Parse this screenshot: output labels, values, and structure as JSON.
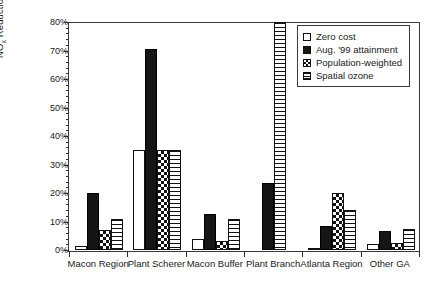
{
  "chart_data": {
    "type": "bar",
    "title": "",
    "xlabel": "",
    "ylabel": "NOx Reduction (%) in Optimal Strategy",
    "ylabel_parts": {
      "prefix": "NO",
      "sub": "x",
      "suffix": " Reduction (%) in Optimal Strategy"
    },
    "ylim": [
      0,
      80
    ],
    "yunit": "%",
    "ytick_labels": [
      "0%",
      "10%",
      "20%",
      "30%",
      "40%",
      "50%",
      "60%",
      "70%",
      "80%"
    ],
    "ytick_values": [
      0,
      10,
      20,
      30,
      40,
      50,
      60,
      70,
      80
    ],
    "yminor_step": 2,
    "grid": false,
    "legend_position": "top-right",
    "categories": [
      "Macon Region",
      "Plant Scherer",
      "Macon Buffer",
      "Plant Branch",
      "Atlanta Region",
      "Other GA"
    ],
    "series": [
      {
        "name": "Zero cost",
        "pattern": "empty",
        "values": [
          1.5,
          35,
          4,
          0,
          0.8,
          2
        ]
      },
      {
        "name": "Aug. '99 attainment",
        "pattern": "solid-black",
        "values": [
          20,
          70.5,
          12.5,
          23.5,
          8.5,
          6.5
        ]
      },
      {
        "name": "Population-weighted",
        "pattern": "checkerboard",
        "values": [
          7,
          35,
          3,
          0,
          20,
          2.5
        ]
      },
      {
        "name": "Spatial ozone",
        "pattern": "horizontal-stripes",
        "values": [
          11,
          35,
          11,
          80,
          14,
          7.5
        ]
      }
    ]
  },
  "legend": {
    "items": [
      {
        "label": "Zero cost",
        "swatch": "zero"
      },
      {
        "label": "Aug. '99 attainment",
        "swatch": "aug"
      },
      {
        "label": "Population-weighted",
        "swatch": "pop"
      },
      {
        "label": "Spatial ozone",
        "swatch": "spatial"
      }
    ]
  },
  "colors": {
    "axis": "#2a2a2a",
    "frame": "#3a3a3a",
    "bar_fill_dark": "#151515",
    "bar_fill_light": "#ffffff",
    "background": "#ffffff"
  }
}
